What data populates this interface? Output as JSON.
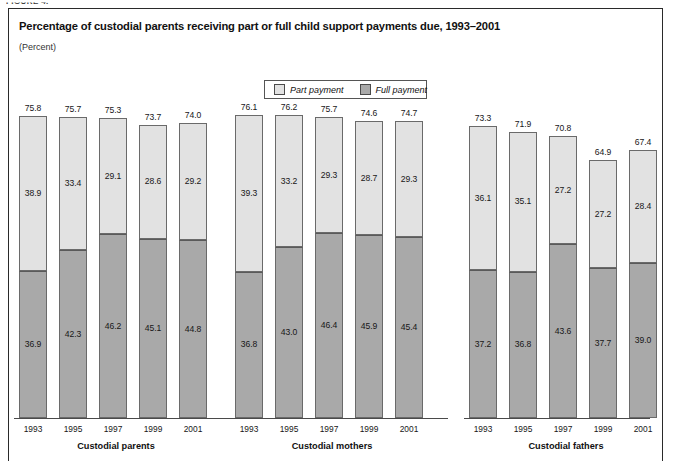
{
  "figure_tag": "FIGURE 4.",
  "header": {
    "title": "Percentage of custodial parents receiving part or full child support payments due, 1993–2001",
    "subtitle": "(Percent)"
  },
  "legend": {
    "items": [
      {
        "label": "Part payment",
        "color": "#e2e2e2",
        "key": "part"
      },
      {
        "label": "Full payment",
        "color": "#a9a9a9",
        "key": "full"
      }
    ]
  },
  "chart_data": {
    "type": "bar",
    "subtype": "stacked",
    "title": "Percentage of custodial parents receiving part or full child support payments due, 1993–2001",
    "xlabel": "",
    "ylabel": "(Percent)",
    "ylim": [
      0,
      80
    ],
    "grid": false,
    "legend_position": "top-center",
    "categories": [
      "1993",
      "1995",
      "1997",
      "1999",
      "2001"
    ],
    "series": [
      {
        "name": "Full payment",
        "color": "#a9a9a9"
      },
      {
        "name": "Part payment",
        "color": "#e2e2e2"
      }
    ],
    "groups": [
      {
        "name": "Custodial parents",
        "bars": [
          {
            "year": "1993",
            "full": 36.9,
            "part": 38.9,
            "total": 75.8
          },
          {
            "year": "1995",
            "full": 42.3,
            "part": 33.4,
            "total": 75.7
          },
          {
            "year": "1997",
            "full": 46.2,
            "part": 29.1,
            "total": 75.3
          },
          {
            "year": "1999",
            "full": 45.1,
            "part": 28.6,
            "total": 73.7
          },
          {
            "year": "2001",
            "full": 44.8,
            "part": 29.2,
            "total": 74.0
          }
        ]
      },
      {
        "name": "Custodial mothers",
        "bars": [
          {
            "year": "1993",
            "full": 36.8,
            "part": 39.3,
            "total": 76.1
          },
          {
            "year": "1995",
            "full": 43.0,
            "part": 33.2,
            "total": 76.2
          },
          {
            "year": "1997",
            "full": 46.4,
            "part": 29.3,
            "total": 75.7
          },
          {
            "year": "1999",
            "full": 45.9,
            "part": 28.7,
            "total": 74.6
          },
          {
            "year": "2001",
            "full": 45.4,
            "part": 29.3,
            "total": 74.7
          }
        ]
      },
      {
        "name": "Custodial fathers",
        "bars": [
          {
            "year": "1993",
            "full": 37.2,
            "part": 36.1,
            "total": 73.3
          },
          {
            "year": "1995",
            "full": 36.8,
            "part": 35.1,
            "total": 71.9
          },
          {
            "year": "1997",
            "full": 43.6,
            "part": 27.2,
            "total": 70.8
          },
          {
            "year": "1999",
            "full": 37.7,
            "part": 27.2,
            "total": 64.9
          },
          {
            "year": "2001",
            "full": 39.0,
            "part": 28.4,
            "total": 67.4
          }
        ]
      }
    ]
  },
  "layout": {
    "baseline_y": 418,
    "px_per_unit": 3.98,
    "bar_width": 28,
    "bar_pitch": 40,
    "group_starts": [
      19,
      235,
      469
    ],
    "axis_segments": [
      {
        "left": 14,
        "width": 218
      },
      {
        "left": 230,
        "width": 218
      },
      {
        "left": 464,
        "width": 186
      }
    ],
    "group_label_centers": [
      116,
      332,
      566
    ]
  }
}
